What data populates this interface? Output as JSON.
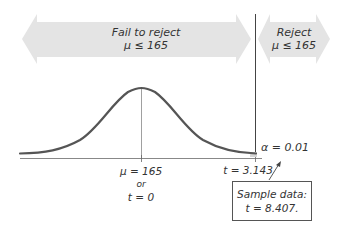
{
  "diagram": {
    "type": "one-tailed hypothesis test (right-tailed t-test)",
    "regions": {
      "fail_to_reject": {
        "label": "Fail to reject",
        "hypothesis": "μ ≤ 165"
      },
      "reject": {
        "label": "Reject",
        "hypothesis": "μ ≤ 165"
      }
    },
    "axis": {
      "center_label": "μ = 165",
      "center_or": "or",
      "center_t": "t = 0",
      "critical_label": "t = 3.143"
    },
    "alpha_label": "α = 0.01",
    "sample_data": {
      "title": "Sample data:",
      "value": "t = 8.407."
    },
    "colors": {
      "arrow_fill": "#e4e4e4",
      "curve": "#555555",
      "axis": "#888888",
      "divider": "#444444",
      "text": "#333333"
    }
  }
}
